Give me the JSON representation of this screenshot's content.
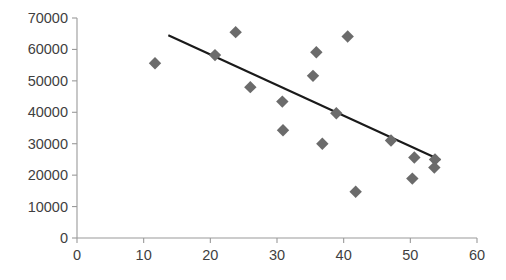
{
  "chart_data": {
    "type": "scatter",
    "title": "",
    "subtitle": "",
    "xlabel": "",
    "ylabel": "",
    "xlim": [
      0,
      60
    ],
    "ylim": [
      0,
      70000
    ],
    "x_ticks": [
      0,
      10,
      20,
      30,
      40,
      50,
      60
    ],
    "x_tick_labels": [
      "0",
      "10",
      "20",
      "30",
      "40",
      "50",
      "60"
    ],
    "y_ticks": [
      0,
      10000,
      20000,
      30000,
      40000,
      50000,
      60000,
      70000
    ],
    "y_tick_labels": [
      "0",
      "10000",
      "20000",
      "30000",
      "40000",
      "50000",
      "60000",
      "70000"
    ],
    "grid": false,
    "legend": false,
    "legend_position": "none",
    "marker_shape": "diamond",
    "marker_color": "#6b6b6b",
    "trendline_color": "#1a1a1a",
    "axis_color": "#9a9a9a",
    "tick_label_color": "#3f3f3f",
    "background_color": "#ffffff",
    "series": [
      {
        "name": "observations",
        "points": [
          {
            "x": 11.7,
            "y": 55600
          },
          {
            "x": 20.7,
            "y": 58200
          },
          {
            "x": 23.8,
            "y": 65500
          },
          {
            "x": 26.0,
            "y": 48000
          },
          {
            "x": 30.8,
            "y": 43400
          },
          {
            "x": 30.9,
            "y": 34300
          },
          {
            "x": 35.4,
            "y": 51600
          },
          {
            "x": 35.9,
            "y": 59100
          },
          {
            "x": 36.8,
            "y": 30000
          },
          {
            "x": 38.9,
            "y": 39700
          },
          {
            "x": 40.6,
            "y": 64100
          },
          {
            "x": 41.8,
            "y": 14700
          },
          {
            "x": 47.1,
            "y": 31000
          },
          {
            "x": 50.3,
            "y": 18900
          },
          {
            "x": 50.6,
            "y": 25600
          },
          {
            "x": 53.7,
            "y": 25000
          },
          {
            "x": 53.6,
            "y": 22400
          }
        ]
      }
    ],
    "trendline": {
      "name": "linear trend",
      "x_start": 13.7,
      "y_start": 64500,
      "x_end": 54.5,
      "y_end": 24800
    }
  }
}
